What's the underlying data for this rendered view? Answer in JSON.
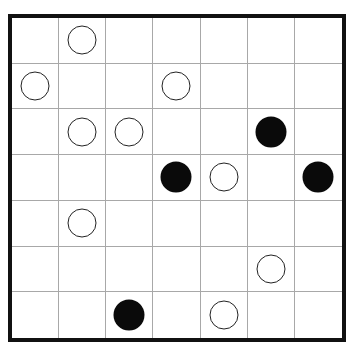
{
  "puzzle": {
    "rows": 7,
    "cols": 7,
    "colors": {
      "border": "#111111",
      "grid": "#a8a8a8",
      "white_circle_stroke": "#222222",
      "black_circle": "#0a0a0a"
    },
    "cells": [
      [
        "",
        "white",
        "",
        "",
        "",
        "",
        ""
      ],
      [
        "white",
        "",
        "",
        "white",
        "",
        "",
        ""
      ],
      [
        "",
        "white",
        "white",
        "",
        "",
        "black",
        ""
      ],
      [
        "",
        "",
        "",
        "black",
        "white",
        "",
        "black"
      ],
      [
        "",
        "white",
        "",
        "",
        "",
        "",
        ""
      ],
      [
        "",
        "",
        "",
        "",
        "",
        "white",
        ""
      ],
      [
        "",
        "",
        "black",
        "",
        "white",
        "",
        ""
      ]
    ]
  }
}
